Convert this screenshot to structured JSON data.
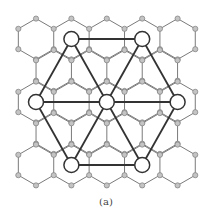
{
  "figure": {
    "caption": "(a)"
  },
  "colors": {
    "background": "#ffffff",
    "lattice_edge": "#7a7a7a",
    "lattice_node_fill": "#c4c4c4",
    "lattice_node_stroke": "#7d7d7d",
    "super_edge": "#333333",
    "super_node_fill": "#ffffff",
    "super_node_stroke": "#333333"
  },
  "lattice": {
    "hex_width": 35.4,
    "circumradius": 20.4,
    "node_radius": 2.6,
    "rows": [
      {
        "y": 39.0,
        "centers_x": [
          36.0,
          71.4,
          106.8,
          142.2,
          177.6
        ]
      },
      {
        "y": 70.5,
        "centers_x": [
          53.7,
          89.1,
          124.5,
          159.9
        ]
      },
      {
        "y": 102.0,
        "centers_x": [
          36.0,
          71.4,
          106.8,
          142.2,
          177.6
        ]
      },
      {
        "y": 133.5,
        "centers_x": [
          53.7,
          89.1,
          124.5,
          159.9
        ]
      },
      {
        "y": 165.0,
        "centers_x": [
          36.0,
          71.4,
          106.8,
          142.2,
          177.6
        ]
      }
    ]
  },
  "superlattice": {
    "node_radius": 7.5,
    "nodes": [
      {
        "id": "top-left",
        "x": 71.4,
        "y": 39.0
      },
      {
        "id": "top-right",
        "x": 142.2,
        "y": 39.0
      },
      {
        "id": "left",
        "x": 36.0,
        "y": 102.0
      },
      {
        "id": "center",
        "x": 106.8,
        "y": 102.0
      },
      {
        "id": "right",
        "x": 177.6,
        "y": 102.0
      },
      {
        "id": "bottom-left",
        "x": 71.4,
        "y": 165.0
      },
      {
        "id": "bottom-right",
        "x": 142.2,
        "y": 165.0
      }
    ],
    "edges": [
      [
        "top-left",
        "top-right"
      ],
      [
        "top-left",
        "left"
      ],
      [
        "top-left",
        "center"
      ],
      [
        "top-right",
        "center"
      ],
      [
        "top-right",
        "right"
      ],
      [
        "left",
        "center"
      ],
      [
        "center",
        "right"
      ],
      [
        "left",
        "bottom-left"
      ],
      [
        "center",
        "bottom-left"
      ],
      [
        "center",
        "bottom-right"
      ],
      [
        "right",
        "bottom-right"
      ],
      [
        "bottom-left",
        "bottom-right"
      ]
    ]
  }
}
